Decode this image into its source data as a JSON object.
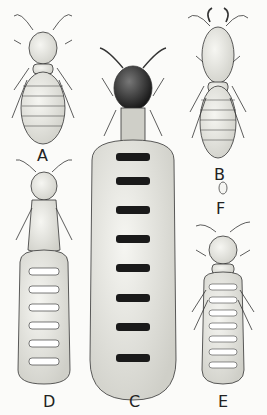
{
  "figure": {
    "labels": {
      "A": "A",
      "B": "B",
      "C": "C",
      "D": "D",
      "E": "E",
      "F": "F"
    },
    "colors": {
      "background": "#fbfbf9",
      "ink": "#222222",
      "body_fill": "#efefea",
      "dark_head": "#2a2a2a"
    }
  }
}
